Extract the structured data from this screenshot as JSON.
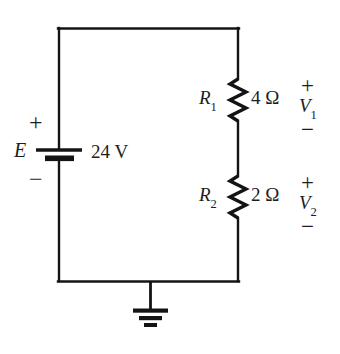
{
  "diagram": {
    "line_color": "#141414",
    "text_color": "#1d1d1d",
    "background": "#ffffff"
  },
  "source": {
    "symbol": "battery",
    "label": "E",
    "value": "24 V",
    "polarity_positive": "+",
    "polarity_negative": "−"
  },
  "components": [
    {
      "id": "R1",
      "symbol": "resistor",
      "label": "R",
      "subscript": "1",
      "value": "4 Ω",
      "voltage_label": "V",
      "voltage_subscript": "1",
      "polarity_positive": "+",
      "polarity_negative": "−"
    },
    {
      "id": "R2",
      "symbol": "resistor",
      "label": "R",
      "subscript": "2",
      "value": "2 Ω",
      "voltage_label": "V",
      "voltage_subscript": "2",
      "polarity_positive": "+",
      "polarity_negative": "−"
    }
  ],
  "ground": {
    "symbol": "earth-ground",
    "label": ""
  }
}
